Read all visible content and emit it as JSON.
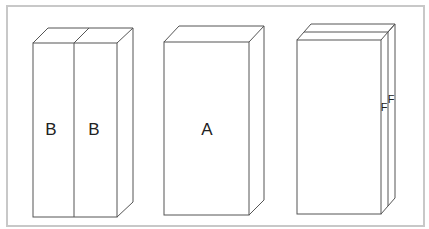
{
  "diagram": {
    "frame_color": "#c8c8c8",
    "line_color": "#555555",
    "boxes": [
      {
        "id": "box-1",
        "panels": [
          "B",
          "B"
        ],
        "description": "two panels side by side"
      },
      {
        "id": "box-2",
        "panels": [
          "A"
        ],
        "description": "single block"
      },
      {
        "id": "box-3",
        "panels": [
          "F",
          "F"
        ],
        "description": "thin layered plates"
      }
    ]
  }
}
